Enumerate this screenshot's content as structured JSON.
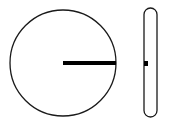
{
  "diagram": {
    "colors": {
      "background": "#ffffff",
      "stroke": "#1a1a1a",
      "radius_line": "#000000"
    },
    "face_view": {
      "shape": "circle",
      "center": [
        63,
        63
      ],
      "radius": 53,
      "radius_line": {
        "from": [
          63,
          63
        ],
        "to": [
          116,
          63
        ],
        "width": 4
      }
    },
    "edge_view": {
      "shape": "pill",
      "x": 144,
      "y": 8,
      "width": 13,
      "height": 109,
      "corner_radius": 6.5,
      "marker": {
        "x": 144,
        "y": 61,
        "width": 4,
        "height": 5
      }
    }
  }
}
